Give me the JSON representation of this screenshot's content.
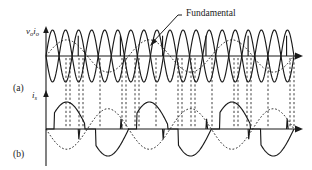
{
  "figure": {
    "type": "waveform-diagram",
    "background": "#ffffff",
    "stroke": "#1a1a1a",
    "width": 312,
    "height": 170
  },
  "annotations": {
    "fundamental_label": "Fundamental",
    "panel_a_label": "(a)",
    "panel_b_label": "(b)"
  },
  "axes": {
    "a": {
      "y_label_main": "v",
      "y_label_sub": "o",
      "y_label_main2": "i",
      "y_label_sub2": "o",
      "y_label_text": "vo io",
      "origin_x": 46,
      "baseline_y": 56,
      "axis_top_y": 28,
      "axis_right_x": 300,
      "amplitude": 26
    },
    "b": {
      "y_label_main": "i",
      "y_label_sub": "s",
      "y_label_text": "is",
      "origin_x": 46,
      "baseline_y": 129,
      "axis_top_y": 92,
      "axis_right_x": 300,
      "amplitude": 27
    }
  },
  "chart_data": {
    "type": "line",
    "title": "",
    "xlabel": "",
    "ylabel": "",
    "panels": [
      {
        "id": "a",
        "ylabel": "vo, io",
        "series": [
          {
            "name": "output-voltage-envelope-positive",
            "style": "solid",
            "description": "high-frequency sinusoid, positive lobes chain",
            "cycles": 9.5,
            "amplitude": 1.0,
            "phase": 0
          },
          {
            "name": "output-voltage-envelope-negative",
            "style": "solid",
            "description": "high-frequency sinusoid inverted, forms lens pattern",
            "cycles": 9.5,
            "amplitude": 1.0,
            "phase": 3.14159
          },
          {
            "name": "fundamental",
            "style": "dotted",
            "description": "low-frequency fundamental component",
            "cycles": 3.0,
            "amplitude": 0.62,
            "phase": 0
          }
        ],
        "commutation_x": [
          0.13,
          0.3,
          0.47,
          0.645,
          0.815,
          0.97
        ]
      },
      {
        "id": "b",
        "ylabel": "is",
        "series": [
          {
            "name": "source-current",
            "style": "solid",
            "description": "source current with commutation spikes",
            "cycles": 3.0,
            "amplitude": 1.0,
            "phase": 0
          },
          {
            "name": "source-current-reference",
            "style": "dotted",
            "description": "dotted reference sinusoid",
            "cycles": 3.0,
            "amplitude": 0.75,
            "phase": 3.14159
          }
        ]
      }
    ],
    "dashed_connectors_x": [
      66,
      70,
      79,
      83,
      100,
      122,
      126,
      135,
      139,
      156,
      178,
      182,
      191,
      195,
      212,
      234,
      238,
      247,
      251,
      268,
      290,
      294
    ]
  }
}
